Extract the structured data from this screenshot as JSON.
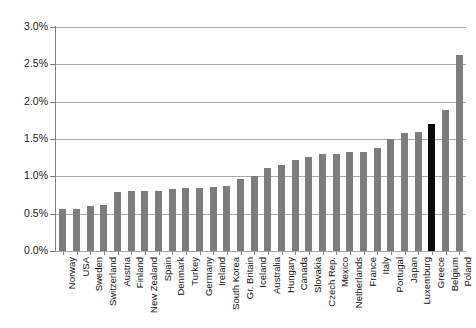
{
  "chart_data": {
    "type": "bar",
    "title": "",
    "subtitle": "",
    "xlabel": "",
    "ylabel": "",
    "ylim": [
      0,
      3.0
    ],
    "ytick_labels": [
      "0.0%",
      "0.5%",
      "1.0%",
      "1.5%",
      "2.0%",
      "2.5%",
      "3.0%"
    ],
    "ytick_values": [
      0.0,
      0.5,
      1.0,
      1.5,
      2.0,
      2.5,
      3.0
    ],
    "grid": true,
    "legend": "none",
    "value_unit": "percent",
    "bar_color": "#7d7d7d",
    "highlight_color": "#0a0a0a",
    "highlight_category": "Greece",
    "categories": [
      "Norway",
      "USA",
      "Sweden",
      "Switzerland",
      "Austria",
      "Finland",
      "New Zealand",
      "Spain",
      "Denmark",
      "Turkey",
      "Germany",
      "Ireland",
      "South Korea",
      "Gr. Britain",
      "Iceland",
      "Australia",
      "Hungary",
      "Canada",
      "Slovakia",
      "Czech Rep.",
      "Mexico",
      "Netherlands",
      "France",
      "Italy",
      "Portugal",
      "Japan",
      "Luxemburg",
      "Greece",
      "Belgium",
      "Poland"
    ],
    "values": [
      0.56,
      0.56,
      0.6,
      0.62,
      0.79,
      0.8,
      0.81,
      0.81,
      0.83,
      0.85,
      0.85,
      0.86,
      0.87,
      0.97,
      1.01,
      1.11,
      1.15,
      1.22,
      1.26,
      1.3,
      1.3,
      1.32,
      1.33,
      1.38,
      1.5,
      1.58,
      1.6,
      1.7,
      1.89,
      2.63
    ],
    "series_name": ""
  }
}
